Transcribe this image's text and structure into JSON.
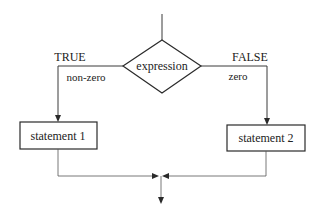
{
  "diagram": {
    "type": "flowchart",
    "decision": {
      "label": "expression"
    },
    "branches": {
      "true": {
        "label": "TRUE",
        "sublabel": "non-zero",
        "statement": "statement 1"
      },
      "false": {
        "label": "FALSE",
        "sublabel": "zero",
        "statement": "statement 2"
      }
    },
    "colors": {
      "stroke": "#2a2a2a",
      "background": "#ffffff",
      "text": "#222222"
    }
  }
}
